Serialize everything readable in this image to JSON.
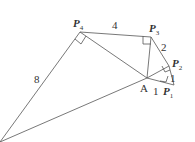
{
  "points": {
    "P4": {
      "name": "P",
      "sub": "4"
    },
    "P3": {
      "name": "P",
      "sub": "3"
    },
    "P2": {
      "name": "P",
      "sub": "2"
    },
    "P1": {
      "name": "P",
      "sub": "1"
    },
    "A": {
      "name": "A"
    }
  },
  "lengths": {
    "P4P3": "4",
    "P3P2": "2",
    "P2P1": "1",
    "AP1": "1",
    "P4B": "8"
  },
  "colors": {
    "line": "#555555",
    "text": "#333333"
  }
}
